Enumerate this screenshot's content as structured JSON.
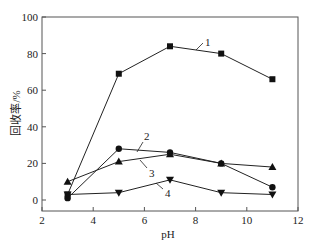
{
  "chart_data": {
    "type": "line",
    "title": "",
    "xlabel": "pH",
    "ylabel": "回收率/%",
    "xlim": [
      2,
      12
    ],
    "ylim": [
      -5,
      100
    ],
    "xticks": [
      2,
      4,
      6,
      8,
      10,
      12
    ],
    "yticks": [
      0,
      20,
      40,
      60,
      80,
      100
    ],
    "grid": false,
    "legend": "inline numeric labels on curves",
    "x": [
      3,
      5,
      7,
      9,
      11
    ],
    "series": [
      {
        "name": "1",
        "marker": "square",
        "values": [
          3,
          69,
          84,
          80,
          66
        ]
      },
      {
        "name": "2",
        "marker": "circle",
        "values": [
          1,
          28,
          26,
          20,
          7
        ]
      },
      {
        "name": "3",
        "marker": "triangle-up",
        "values": [
          10,
          21,
          25,
          20,
          18
        ]
      },
      {
        "name": "4",
        "marker": "triangle-down",
        "values": [
          3,
          4,
          11,
          4,
          3
        ]
      }
    ]
  },
  "axes": {
    "xlabel": "pH",
    "ylabel": "回收率/%",
    "xtick_labels": [
      "2",
      "4",
      "6",
      "8",
      "10",
      "12"
    ],
    "ytick_labels": [
      "0",
      "20",
      "40",
      "60",
      "80",
      "100"
    ]
  },
  "series_labels": [
    "1",
    "2",
    "3",
    "4"
  ]
}
